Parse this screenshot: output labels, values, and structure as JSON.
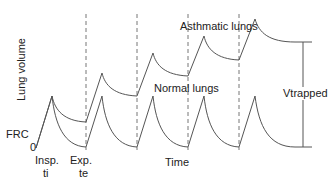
{
  "diagram": {
    "type": "line",
    "labels": {
      "y_axis": "Lung volume",
      "frc": "FRC",
      "origin": "0",
      "insp": "Insp.",
      "ti": "ti",
      "exp": "Exp.",
      "te": "te",
      "x_axis": "Time",
      "asthmatic": "Asthmatic lungs",
      "normal": "Normal lungs",
      "vtrapped": "Vtrapped"
    },
    "colors": {
      "line": "#555555",
      "dashed": "#777777",
      "text": "#222222"
    },
    "dashed_lines_x": [
      86,
      137,
      188,
      239
    ],
    "series": [
      {
        "name": "Asthmatic lungs",
        "peaks": [
          [
            52,
            96
          ],
          [
            102,
            73
          ],
          [
            153,
            53
          ],
          [
            204,
            36
          ],
          [
            255,
            19
          ]
        ],
        "troughs": [
          [
            86,
            122
          ],
          [
            137,
            96
          ],
          [
            188,
            76
          ],
          [
            239,
            60
          ]
        ],
        "end": [
          312,
          42
        ]
      },
      {
        "name": "Normal lungs",
        "peaks": [
          [
            52,
            96
          ],
          [
            102,
            96
          ],
          [
            153,
            96
          ],
          [
            204,
            96
          ],
          [
            255,
            96
          ]
        ],
        "troughs": [
          [
            86,
            147
          ],
          [
            137,
            147
          ],
          [
            188,
            147
          ],
          [
            239,
            147
          ]
        ],
        "end": [
          312,
          147
        ]
      }
    ]
  }
}
